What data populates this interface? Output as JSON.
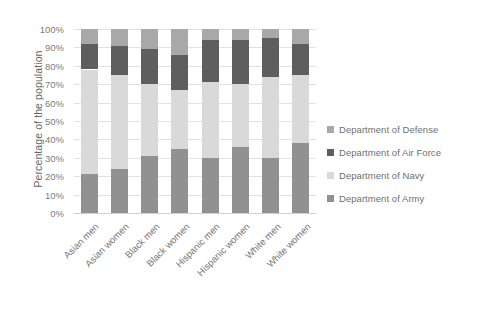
{
  "chart_data": {
    "type": "bar",
    "subtype": "stacked-100-percent",
    "title": "",
    "xlabel": "",
    "ylabel": "Percentage of the population",
    "ylim": [
      0,
      100
    ],
    "ytick_labels": [
      "100%",
      "90%",
      "80%",
      "70%",
      "60%",
      "50%",
      "40%",
      "30%",
      "20%",
      "10%",
      "0%"
    ],
    "ytick_values": [
      100,
      90,
      80,
      70,
      60,
      50,
      40,
      30,
      20,
      10,
      0
    ],
    "grid": true,
    "legend_position": "right",
    "categories": [
      "Asian men",
      "Asian women",
      "Black men",
      "Black women",
      "Hispanic men",
      "Hispanic women",
      "White men",
      "White women"
    ],
    "series": [
      {
        "name": "Department of Army",
        "color": "#919191",
        "values": [
          21,
          24,
          31,
          35,
          30,
          36,
          30,
          38
        ]
      },
      {
        "name": "Department of Navy",
        "color": "#d9d9d9",
        "values": [
          57,
          51,
          39,
          32,
          41,
          34,
          44,
          37
        ]
      },
      {
        "name": "Department of Air Force",
        "color": "#5e5e5e",
        "values": [
          14,
          16,
          19,
          19,
          23,
          24,
          21,
          17
        ]
      },
      {
        "name": "Department of Defense",
        "color": "#a8a8a8",
        "values": [
          8,
          9,
          11,
          14,
          6,
          6,
          5,
          8
        ]
      }
    ]
  },
  "legend": {
    "items": [
      {
        "label": "Department of Defense",
        "color": "#a8a8a8"
      },
      {
        "label": "Department of Air Force",
        "color": "#5e5e5e"
      },
      {
        "label": "Department of Navy",
        "color": "#d9d9d9"
      },
      {
        "label": "Department of Army",
        "color": "#919191"
      }
    ]
  }
}
